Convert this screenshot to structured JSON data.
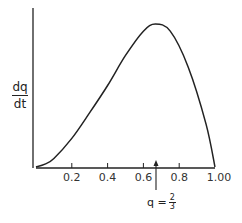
{
  "chart_data": {
    "type": "line",
    "title": "",
    "xlabel": "",
    "ylabel": "dq/dt",
    "ylabel_num": "dq",
    "ylabel_den": "dt",
    "xlim": [
      0,
      1.0
    ],
    "x_ticks": [
      "0.2",
      "0.4",
      "0.6",
      "0.8",
      "1.00"
    ],
    "x_tick_values": [
      0.2,
      0.4,
      0.6,
      0.8,
      1.0
    ],
    "grid": false,
    "series": [
      {
        "name": "dq/dt",
        "x": [
          0,
          0.05,
          0.1,
          0.2,
          0.3,
          0.4,
          0.5,
          0.6,
          0.667,
          0.75,
          0.85,
          0.95,
          1.0
        ],
        "y": [
          0,
          0.02,
          0.06,
          0.2,
          0.38,
          0.57,
          0.78,
          0.95,
          1.0,
          0.95,
          0.7,
          0.3,
          0
        ]
      }
    ],
    "annotations": [
      {
        "text": "q = 2/3",
        "x": 0.667,
        "type": "arrow",
        "prefix": "q =",
        "num": "2",
        "den": "3"
      }
    ]
  }
}
